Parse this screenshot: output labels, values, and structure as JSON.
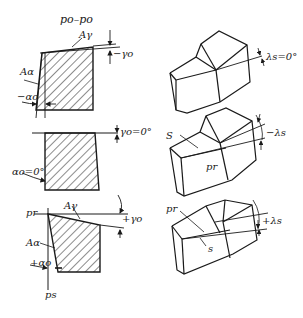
{
  "figure": {
    "title": "po–po",
    "colors": {
      "ink": "#1a1a1a",
      "background": "#ffffff"
    }
  },
  "sections": [
    {
      "id": "negative-rake",
      "labels": {
        "rake_face": "Aγ",
        "flank_face": "Aα",
        "rake_angle": "−γo",
        "clearance_angle": "−αo"
      }
    },
    {
      "id": "zero-rake",
      "labels": {
        "rake_angle": "γo=0°",
        "clearance_angle": "αo=0°"
      }
    },
    {
      "id": "positive-rake",
      "labels": {
        "reference_plane": "pr",
        "rake_face": "Aγ",
        "flank_face": "Aα",
        "rake_angle": "+γo",
        "clearance_angle": "+αo",
        "cutting_plane": "ps"
      }
    }
  ],
  "tools_3d": [
    {
      "id": "lambda-zero",
      "labels": {
        "inclination": "λs=0°"
      }
    },
    {
      "id": "lambda-negative",
      "labels": {
        "edge": "S",
        "reference_plane": "pr",
        "inclination": "−λs"
      }
    },
    {
      "id": "lambda-positive",
      "labels": {
        "reference_plane": "pr",
        "edge": "s",
        "inclination": "+λs"
      }
    }
  ]
}
